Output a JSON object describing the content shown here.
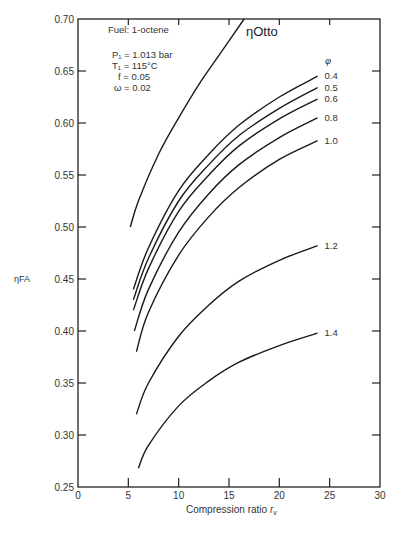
{
  "chart_data": {
    "type": "line",
    "title": "",
    "xlabel": "Compression ratio r_v",
    "ylabel": "η_FA",
    "xlim": [
      0,
      30
    ],
    "ylim": [
      0.25,
      0.7
    ],
    "x_ticks": [
      0,
      5,
      10,
      15,
      20,
      25,
      30
    ],
    "y_ticks": [
      0.25,
      0.3,
      0.35,
      0.4,
      0.45,
      0.5,
      0.55,
      0.6,
      0.65,
      0.7
    ],
    "x_tick_labels": [
      "0",
      "5",
      "10",
      "15",
      "20",
      "25",
      "30"
    ],
    "y_tick_labels": [
      "0.25",
      "0.30",
      "0.35",
      "0.40",
      "0.45",
      "0.50",
      "0.55",
      "0.60",
      "0.65",
      "0.70"
    ],
    "grid": false,
    "legend": "inline labels at curve ends",
    "annotations": {
      "fuel": "Fuel: 1-octene",
      "conditions": [
        "P₁ = 1.013 bar",
        "T₁ = 115°C",
        "f = 0.05",
        "ω = 0.02"
      ],
      "phi_header": "φ",
      "otto_label": "ηOtto"
    },
    "series": [
      {
        "name": "ηOtto",
        "label": "ηOtto",
        "x": [
          5.2,
          6,
          8,
          10,
          12,
          14,
          16.5
        ],
        "y": [
          0.5,
          0.525,
          0.57,
          0.605,
          0.637,
          0.665,
          0.7
        ]
      },
      {
        "name": "φ = 0.4",
        "label": "0.4",
        "x": [
          5.5,
          7,
          10,
          13,
          16,
          20,
          23.8
        ],
        "y": [
          0.44,
          0.48,
          0.535,
          0.57,
          0.598,
          0.625,
          0.645
        ]
      },
      {
        "name": "φ = 0.5",
        "label": "0.5",
        "x": [
          5.5,
          7,
          10,
          13,
          16,
          20,
          23.8
        ],
        "y": [
          0.43,
          0.47,
          0.525,
          0.56,
          0.588,
          0.614,
          0.634
        ]
      },
      {
        "name": "φ = 0.6",
        "label": "0.6",
        "x": [
          5.5,
          7,
          10,
          13,
          16,
          20,
          23.8
        ],
        "y": [
          0.42,
          0.46,
          0.515,
          0.55,
          0.578,
          0.604,
          0.623
        ]
      },
      {
        "name": "φ = 0.8",
        "label": "0.8",
        "x": [
          5.6,
          7,
          10,
          13,
          16,
          20,
          23.8
        ],
        "y": [
          0.4,
          0.44,
          0.495,
          0.532,
          0.56,
          0.586,
          0.605
        ]
      },
      {
        "name": "φ = 1.0",
        "label": "1.0",
        "x": [
          5.8,
          7,
          10,
          13,
          16,
          20,
          23.8
        ],
        "y": [
          0.38,
          0.418,
          0.473,
          0.51,
          0.538,
          0.565,
          0.583
        ]
      },
      {
        "name": "φ = 1.2",
        "label": "1.2",
        "x": [
          5.8,
          7,
          10,
          13,
          16,
          20,
          23.8
        ],
        "y": [
          0.32,
          0.35,
          0.395,
          0.425,
          0.448,
          0.468,
          0.482
        ]
      },
      {
        "name": "φ = 1.4",
        "label": "1.4",
        "x": [
          6.0,
          7,
          10,
          13,
          16,
          20,
          23.8
        ],
        "y": [
          0.268,
          0.29,
          0.328,
          0.352,
          0.37,
          0.386,
          0.398
        ]
      }
    ]
  },
  "labels": {
    "xlabel_main": "Compression ratio ",
    "xlabel_var": "r",
    "xlabel_sub": "v",
    "ylabel": "ηFA"
  }
}
